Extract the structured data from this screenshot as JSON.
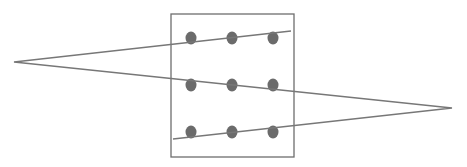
{
  "diagram": {
    "title": "",
    "width": 467,
    "height": 167,
    "colors": {
      "background": "#ffffff",
      "box_stroke": "#6e6e6e",
      "line_stroke": "#777777",
      "dot_fill": "#6b6b6b"
    },
    "box": {
      "x": 171,
      "y": 14,
      "width": 123,
      "height": 143
    },
    "dots": [
      {
        "row": 1,
        "col": 1,
        "cx": 191,
        "cy": 38
      },
      {
        "row": 1,
        "col": 2,
        "cx": 232,
        "cy": 38
      },
      {
        "row": 1,
        "col": 3,
        "cx": 273,
        "cy": 38
      },
      {
        "row": 2,
        "col": 1,
        "cx": 191,
        "cy": 85
      },
      {
        "row": 2,
        "col": 2,
        "cx": 232,
        "cy": 85
      },
      {
        "row": 2,
        "col": 3,
        "cx": 273,
        "cy": 85
      },
      {
        "row": 3,
        "col": 1,
        "cx": 191,
        "cy": 132
      },
      {
        "row": 3,
        "col": 2,
        "cx": 232,
        "cy": 132
      },
      {
        "row": 3,
        "col": 3,
        "cx": 273,
        "cy": 132
      }
    ],
    "dot_radius": {
      "rx": 5.5,
      "ry": 6.5
    },
    "path": [
      {
        "x": 291,
        "y": 31
      },
      {
        "x": 14,
        "y": 62
      },
      {
        "x": 452,
        "y": 108
      },
      {
        "x": 173,
        "y": 139
      }
    ]
  }
}
